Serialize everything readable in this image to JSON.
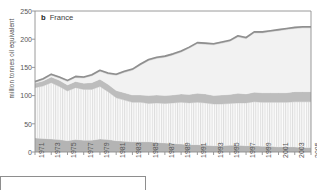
{
  "panel": {
    "letter": "b",
    "name": "France"
  },
  "chart_data": {
    "type": "area",
    "xlabel": "",
    "ylabel": "million tonnes oil equivalent",
    "ylim": [
      0,
      250
    ],
    "yticks": [
      0,
      50,
      100,
      150,
      200,
      250
    ],
    "xlim": [
      1971,
      2005
    ],
    "xticks": [
      1971,
      1973,
      1975,
      1977,
      1979,
      1981,
      1983,
      1985,
      1987,
      1989,
      1991,
      1993,
      1995,
      1997,
      1999,
      2001,
      2003,
      2005
    ],
    "xtick_labels": [
      "1971",
      "1973",
      "1975",
      "1977",
      "1979",
      "1981",
      "1983",
      "1985",
      "1987",
      "1989",
      "1991",
      "1993",
      "1995",
      "1997",
      "1999",
      "2001",
      "2003",
      "2005"
    ],
    "grid": false,
    "legend": "none",
    "stacked": true,
    "x": [
      1971,
      1972,
      1973,
      1974,
      1975,
      1976,
      1977,
      1978,
      1979,
      1980,
      1981,
      1982,
      1983,
      1984,
      1985,
      1986,
      1987,
      1988,
      1989,
      1990,
      1991,
      1992,
      1993,
      1994,
      1995,
      1996,
      1997,
      1998,
      1999,
      2000,
      2001,
      2002,
      2003,
      2004,
      2005
    ],
    "series": [
      {
        "name": "coal",
        "fill": "#b4b4b4",
        "pattern": "solid",
        "values": [
          25,
          24,
          23,
          22,
          20,
          22,
          21,
          21,
          23,
          22,
          20,
          19,
          18,
          18,
          18,
          17,
          16,
          15,
          14,
          13,
          13,
          12,
          11,
          11,
          12,
          12,
          11,
          11,
          10,
          10,
          9,
          9,
          9,
          8,
          8
        ]
      },
      {
        "name": "oil",
        "fill": "#eeeeee",
        "pattern": "vertical-hatch",
        "values": [
          89,
          93,
          100,
          94,
          88,
          92,
          90,
          90,
          93,
          85,
          76,
          73,
          70,
          70,
          68,
          70,
          70,
          72,
          74,
          74,
          75,
          75,
          74,
          74,
          74,
          75,
          76,
          78,
          78,
          78,
          79,
          79,
          80,
          81,
          81
        ]
      },
      {
        "name": "gas",
        "fill": "#bdbdbd",
        "pattern": "solid",
        "values": [
          8,
          9,
          10,
          11,
          11,
          11,
          11,
          12,
          13,
          13,
          13,
          13,
          13,
          13,
          14,
          14,
          14,
          14,
          15,
          15,
          16,
          16,
          15,
          16,
          16,
          17,
          16,
          17,
          17,
          17,
          17,
          17,
          18,
          18,
          18
        ]
      },
      {
        "name": "nuclear-and-other",
        "fill": "#f2f2f2",
        "pattern": "solid",
        "values": [
          1,
          2,
          3,
          4,
          6,
          7,
          9,
          12,
          14,
          18,
          27,
          36,
          44,
          53,
          62,
          65,
          68,
          71,
          74,
          82,
          88,
          88,
          90,
          92,
          94,
          100,
          98,
          105,
          106,
          108,
          110,
          112,
          112,
          113,
          113
        ]
      },
      {
        "name": "renewables",
        "fill": "#c3c3c3",
        "pattern": "solid",
        "values": [
          2,
          2,
          2,
          2,
          2,
          2,
          2,
          2,
          2,
          2,
          2,
          2,
          2,
          2,
          2,
          2,
          2,
          2,
          2,
          2,
          2,
          2,
          2,
          2,
          2,
          2,
          2,
          2,
          2,
          2,
          2,
          2,
          2,
          2,
          2
        ]
      }
    ],
    "total": [
      125,
      130,
      138,
      133,
      127,
      134,
      133,
      137,
      145,
      140,
      138,
      143,
      147,
      156,
      164,
      168,
      170,
      174,
      179,
      186,
      194,
      193,
      192,
      195,
      198,
      206,
      203,
      213,
      213,
      215,
      217,
      219,
      221,
      222,
      222
    ],
    "top_line_color": "#8f8f8f",
    "axis_color": "#8e8e8e"
  }
}
